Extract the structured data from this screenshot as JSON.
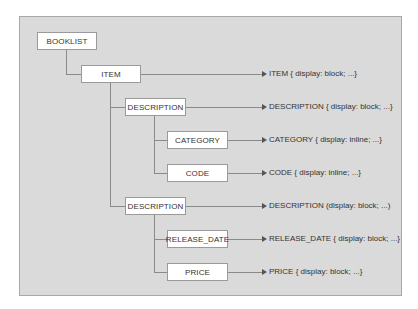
{
  "diagram": {
    "type": "tree-to-css-mapping",
    "nodes": [
      {
        "id": "booklist",
        "label": "BOOKLIST",
        "x": 37,
        "y": 32,
        "w": 60
      },
      {
        "id": "item",
        "label": "ITEM",
        "x": 81,
        "y": 65,
        "w": 60
      },
      {
        "id": "description1",
        "label": "DESCRIPTION",
        "x": 125,
        "y": 98,
        "w": 61
      },
      {
        "id": "category",
        "label": "CATEGORY",
        "x": 167,
        "y": 131,
        "w": 61
      },
      {
        "id": "code",
        "label": "CODE",
        "x": 167,
        "y": 164,
        "w": 61
      },
      {
        "id": "description2",
        "label": "DESCRIPTION",
        "x": 125,
        "y": 197,
        "w": 61
      },
      {
        "id": "release_date",
        "label": "RELEASE_DATE",
        "x": 167,
        "y": 230,
        "w": 61
      },
      {
        "id": "price",
        "label": "PRICE",
        "x": 167,
        "y": 263,
        "w": 61
      }
    ],
    "rules": [
      {
        "node": "item",
        "text": "ITEM { display: block; ...}"
      },
      {
        "node": "description1",
        "text": "DESCRIPTION { display: block; ...}"
      },
      {
        "node": "category",
        "text": "CATEGORY { display: inline; ...}"
      },
      {
        "node": "code",
        "text": "CODE { display: inline; ...}"
      },
      {
        "node": "description2",
        "text": "DESCRIPTION (display: block; ...)"
      },
      {
        "node": "release_date",
        "text": "RELEASE_DATE { display: block; ...}"
      },
      {
        "node": "price",
        "text": "PRICE { display: block; ...}"
      }
    ],
    "colors": {
      "panel": "#dadada",
      "panel_border": "#a8a8a8",
      "node_bg": "#ffffff",
      "line": "#8a8a8a",
      "text": "#333333"
    }
  }
}
